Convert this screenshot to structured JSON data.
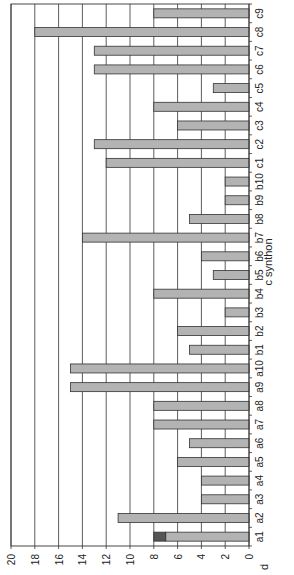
{
  "chart_data": {
    "type": "bar",
    "orientation": "horizontal (figure rotated 90° clockwise)",
    "title": "",
    "xlabel": "c synthon",
    "ylabel": "d",
    "ylim": [
      0,
      20
    ],
    "yticks": [
      0,
      2,
      4,
      6,
      8,
      10,
      12,
      14,
      16,
      18,
      20
    ],
    "grid": true,
    "legend": null,
    "categories": [
      "a1",
      "a2",
      "a3",
      "a4",
      "a5",
      "a6",
      "a7",
      "a8",
      "a9",
      "a10",
      "b1",
      "b2",
      "b3",
      "b4",
      "b5",
      "b6",
      "b7",
      "b8",
      "b9",
      "b10",
      "c1",
      "c2",
      "c3",
      "c4",
      "c5",
      "c6",
      "c7",
      "c8",
      "c9"
    ],
    "series": [
      {
        "name": "main",
        "color": "#b3b3b3",
        "values": [
          7,
          11,
          4,
          4,
          6,
          5,
          8,
          8,
          15,
          15,
          5,
          6,
          2,
          8,
          3,
          4,
          14,
          5,
          2,
          2,
          12,
          13,
          6,
          8,
          3,
          13,
          13,
          18,
          8
        ]
      },
      {
        "name": "stacked",
        "color": "#555555",
        "values": [
          1,
          0,
          0,
          0,
          0,
          0,
          0,
          0,
          0,
          0,
          0,
          0,
          0,
          0,
          0,
          0,
          0,
          0,
          0,
          0,
          0,
          0,
          0,
          0,
          0,
          0,
          0,
          0,
          0
        ]
      }
    ],
    "totals": [
      8,
      11,
      4,
      4,
      6,
      5,
      8,
      8,
      15,
      15,
      5,
      6,
      2,
      8,
      3,
      4,
      14,
      5,
      2,
      2,
      12,
      13,
      6,
      8,
      3,
      13,
      13,
      18,
      8
    ]
  }
}
